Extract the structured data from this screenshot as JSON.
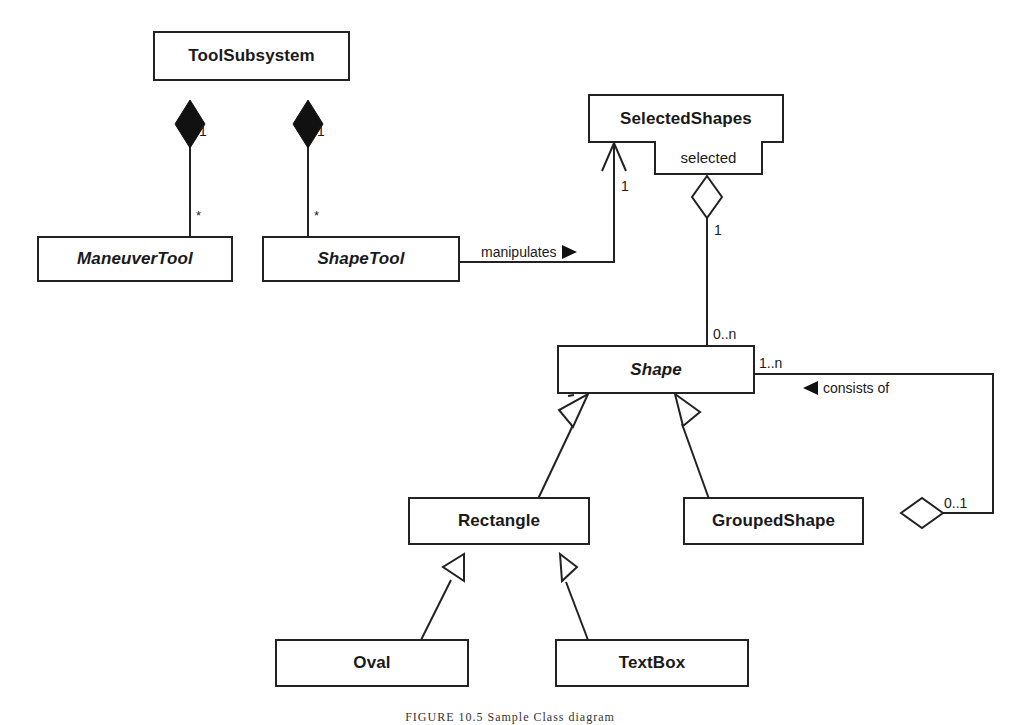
{
  "diagram": {
    "type": "uml-class-diagram",
    "classes": [
      {
        "id": "ToolSubsystem",
        "name": "ToolSubsystem",
        "abstract": false
      },
      {
        "id": "ManeuverTool",
        "name": "ManeuverTool",
        "abstract": true
      },
      {
        "id": "ShapeTool",
        "name": "ShapeTool",
        "abstract": true
      },
      {
        "id": "SelectedShapes",
        "name": "SelectedShapes",
        "abstract": false,
        "qualifier": "selected"
      },
      {
        "id": "Shape",
        "name": "Shape",
        "abstract": true
      },
      {
        "id": "Rectangle",
        "name": "Rectangle",
        "abstract": false
      },
      {
        "id": "GroupedShape",
        "name": "GroupedShape",
        "abstract": false
      },
      {
        "id": "Oval",
        "name": "Oval",
        "abstract": false
      },
      {
        "id": "TextBox",
        "name": "TextBox",
        "abstract": false
      }
    ],
    "relationships": [
      {
        "type": "composition",
        "from": "ToolSubsystem",
        "to": "ManeuverTool",
        "whole_multiplicity": "1",
        "part_multiplicity": "*"
      },
      {
        "type": "composition",
        "from": "ToolSubsystem",
        "to": "ShapeTool",
        "whole_multiplicity": "1",
        "part_multiplicity": "*"
      },
      {
        "type": "association",
        "from": "ShapeTool",
        "to": "SelectedShapes",
        "label": "manipulates",
        "direction_arrow": "right",
        "target_multiplicity": "1",
        "navigable": true
      },
      {
        "type": "aggregation",
        "from": "SelectedShapes",
        "to": "Shape",
        "qualifier": "selected",
        "whole_multiplicity": "1",
        "part_multiplicity": "0..n"
      },
      {
        "type": "generalization",
        "child": "Rectangle",
        "parent": "Shape"
      },
      {
        "type": "generalization",
        "child": "GroupedShape",
        "parent": "Shape"
      },
      {
        "type": "generalization",
        "child": "Oval",
        "parent": "Rectangle"
      },
      {
        "type": "generalization",
        "child": "TextBox",
        "parent": "Rectangle"
      },
      {
        "type": "aggregation",
        "from": "GroupedShape",
        "to": "Shape",
        "label": "consists of",
        "direction_arrow": "left",
        "whole_multiplicity": "0..1",
        "part_multiplicity": "1..n"
      }
    ],
    "labels": {
      "comp1_whole": "1",
      "comp1_part": "*",
      "comp2_whole": "1",
      "comp2_part": "*",
      "manipulates": "manipulates",
      "manipulates_arrow": "▶",
      "selected_target_mult": "1",
      "agg_whole": "1",
      "agg_part": "0..n",
      "consists_part": "1..n",
      "consists_of": "consists of",
      "consists_arrow": "◀",
      "consists_whole": "0..1"
    },
    "caption": "FIGURE 10.5   Sample Class diagram"
  }
}
